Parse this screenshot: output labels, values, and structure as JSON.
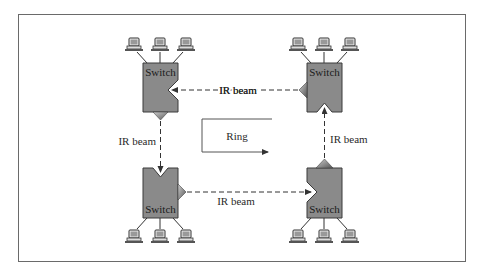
{
  "diagram": {
    "title": "",
    "switch_label": "Switch",
    "beam_label": "IR beam",
    "ring_label": "Ring",
    "colors": {
      "switch_fill": "#8a8a8a",
      "switch_stroke": "#3a3a3a",
      "frame": "#6a6a6a",
      "line": "#333333"
    },
    "switches": [
      {
        "id": "top-left",
        "label": "Switch"
      },
      {
        "id": "top-right",
        "label": "Switch"
      },
      {
        "id": "bottom-left",
        "label": "Switch"
      },
      {
        "id": "bottom-right",
        "label": "Switch"
      }
    ],
    "beams": [
      {
        "id": "top",
        "label": "IR beam",
        "direction": "right-to-left"
      },
      {
        "id": "left",
        "label": "IR beam",
        "direction": "top-to-bottom"
      },
      {
        "id": "bottom",
        "label": "IR beam",
        "direction": "left-to-right"
      },
      {
        "id": "right",
        "label": "IR beam",
        "direction": "bottom-to-top"
      }
    ],
    "computers_per_switch": 3
  }
}
